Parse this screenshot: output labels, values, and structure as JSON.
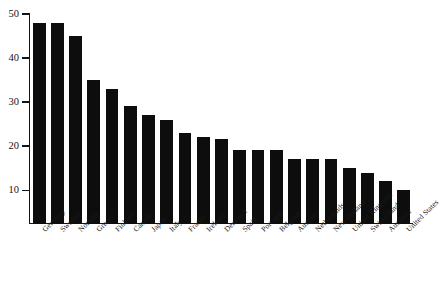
{
  "chart_data": {
    "type": "bar",
    "title": "",
    "subtitle": "",
    "xlabel": "",
    "ylabel": "",
    "ylim": [
      2.3,
      50
    ],
    "yticks": [
      10,
      20,
      30,
      40,
      50
    ],
    "grid": false,
    "legend": null,
    "orientation": "vertical",
    "bar_color": "#0d0d0d",
    "categories": [
      "Germany",
      "Sweden",
      "Norway",
      "Greece",
      "Finland",
      "Canada",
      "Japan",
      "Italy",
      "France",
      "Ireland",
      "Denmark",
      "Spain",
      "Portugal",
      "Belgium",
      "Austria",
      "Netherlands",
      "New Zealand",
      "United Kingdom",
      "Switzerland",
      "Australia",
      "United States"
    ],
    "values": [
      48,
      48,
      45,
      35,
      33,
      29,
      27,
      26,
      23,
      22,
      21.5,
      19,
      19,
      19,
      17,
      17,
      17,
      15,
      14,
      12,
      10
    ]
  },
  "axes": {
    "y_tick_labels": [
      "10",
      "20",
      "30",
      "40",
      "50"
    ]
  },
  "caption": {
    "text": ""
  }
}
